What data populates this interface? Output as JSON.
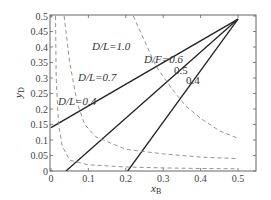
{
  "chart_data": {
    "type": "line",
    "title": "",
    "xlabel": "x_B",
    "ylabel": "y_D",
    "xlim": [
      0,
      0.55
    ],
    "ylim": [
      0,
      0.5
    ],
    "grid": false,
    "x_ticks": [
      "0",
      "0.1",
      "0.2",
      "0.3",
      "0.4",
      "0.5"
    ],
    "y_ticks": [
      "0",
      "0.05",
      "0.1",
      "0.15",
      "0.2",
      "0.25",
      "0.3",
      "0.35",
      "0.4",
      "0.45",
      "0.5"
    ],
    "series": [
      {
        "name": "D/F=0.6",
        "style": "solid",
        "x": [
          0,
          0.5
        ],
        "y": [
          0.14,
          0.49
        ]
      },
      {
        "name": "D/F=0.5",
        "style": "solid",
        "x": [
          0.04,
          0.5
        ],
        "y": [
          0,
          0.49
        ]
      },
      {
        "name": "D/F=0.4",
        "style": "solid",
        "x": [
          0.205,
          0.5
        ],
        "y": [
          0,
          0.49
        ]
      },
      {
        "name": "D/L=0.4",
        "style": "dashed",
        "x": [
          0.012,
          0.014,
          0.02,
          0.03,
          0.05,
          0.1,
          0.2,
          0.3,
          0.4,
          0.5
        ],
        "y": [
          0.5,
          0.3,
          0.15,
          0.08,
          0.035,
          0.02,
          0.013,
          0.01,
          0.008,
          0.007
        ]
      },
      {
        "name": "D/L=0.7",
        "style": "dashed",
        "x": [
          0.035,
          0.05,
          0.07,
          0.09,
          0.12,
          0.16,
          0.2,
          0.3,
          0.4,
          0.5
        ],
        "y": [
          0.5,
          0.35,
          0.22,
          0.15,
          0.11,
          0.09,
          0.07,
          0.055,
          0.045,
          0.04
        ]
      },
      {
        "name": "D/L=1.0",
        "style": "dashed",
        "x": [
          0.22,
          0.25,
          0.28,
          0.32,
          0.36,
          0.4,
          0.45,
          0.5
        ],
        "y": [
          0.5,
          0.42,
          0.34,
          0.27,
          0.21,
          0.17,
          0.13,
          0.105
        ]
      }
    ],
    "annotations": [
      {
        "text": "D/L=1.0",
        "x": 0.105,
        "y": 0.375
      },
      {
        "text": "D/F=0.6",
        "x": 0.155,
        "y": 0.34
      },
      {
        "text": "0.5",
        "x": 0.225,
        "y": 0.285
      },
      {
        "text": "0.4",
        "x": 0.265,
        "y": 0.24
      },
      {
        "text": "D/L=0.7",
        "x": 0.07,
        "y": 0.29
      },
      {
        "text": "D/L=0.4",
        "x": 0.01,
        "y": 0.2
      }
    ]
  },
  "labels": {
    "xlabel_main": "x",
    "xlabel_sub": "B",
    "ylabel_main": "y",
    "ylabel_sub": "D",
    "ann_dl10": "D/L=1.0",
    "ann_df06": "D/F=0.6",
    "ann_05": "0.5",
    "ann_04": "0.4",
    "ann_dl07": "D/L=0.7",
    "ann_dl04": "D/L=0.4"
  }
}
